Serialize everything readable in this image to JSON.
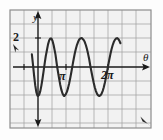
{
  "figure": {
    "name": "trig-graph",
    "background_color": "#fdfdfd",
    "grid_color": "#9a9a9a",
    "curve_color": "#2b2b2b",
    "axis_color": "#1a1a1a",
    "border_color": "#8d8d8d"
  },
  "labels": {
    "y_axis": "y",
    "x_axis": "θ",
    "y_tick_2": "2",
    "x_tick_pi": "π",
    "x_tick_2pi": "2π"
  },
  "chart_data": {
    "type": "line",
    "title": "",
    "xlabel": "θ",
    "ylabel": "y",
    "function": "y = -2 cos(2θ)",
    "amplitude": 2,
    "period": 3.14159,
    "frequency": 2,
    "xlim": [
      -0.55,
      7.4
    ],
    "ylim": [
      -2.75,
      2.75
    ],
    "xticks": [
      3.14159,
      6.28319
    ],
    "xticklabels": [
      "π",
      "2π"
    ],
    "yticks": [
      2
    ],
    "yticklabels": [
      "2"
    ],
    "grid": true,
    "grid_spacing_x": 0.3927,
    "grid_spacing_y": 0.55,
    "legend": "none",
    "x": [
      -0.55,
      -0.45,
      -0.35,
      -0.25,
      -0.15,
      -0.05,
      0.0,
      0.1,
      0.2,
      0.3,
      0.4,
      0.5,
      0.6,
      0.7,
      0.79,
      0.9,
      1.0,
      1.1,
      1.2,
      1.3,
      1.4,
      1.5,
      1.57,
      1.7,
      1.8,
      1.9,
      2.0,
      2.1,
      2.2,
      2.3,
      2.36,
      2.5,
      2.6,
      2.7,
      2.8,
      2.9,
      3.0,
      3.1,
      3.14,
      3.3,
      3.4,
      3.5,
      3.6,
      3.7,
      3.8,
      3.93,
      4.1,
      4.2,
      4.3,
      4.4,
      4.5,
      4.6,
      4.71,
      4.9,
      5.0,
      5.1,
      5.2,
      5.3,
      5.4,
      5.5,
      5.6,
      5.7,
      5.8,
      5.9,
      6.0,
      6.1,
      6.2,
      6.28,
      6.4,
      6.5,
      6.6,
      6.7,
      6.8,
      6.9,
      7.0,
      7.1,
      7.2,
      7.3,
      7.4
    ],
    "y": [
      0.88,
      0.16,
      -0.6,
      -1.25,
      -1.73,
      -1.97,
      -2.0,
      -1.92,
      -1.68,
      -1.3,
      -0.83,
      -0.3,
      0.25,
      0.77,
      1.12,
      1.56,
      1.83,
      1.97,
      1.96,
      1.81,
      1.52,
      1.13,
      0.85,
      0.12,
      -0.36,
      -0.82,
      -1.24,
      -1.58,
      -1.83,
      -1.97,
      -2.0,
      -1.87,
      -1.7,
      -1.44,
      -1.12,
      -0.74,
      -0.33,
      0.11,
      0.29,
      0.93,
      1.26,
      1.53,
      1.74,
      1.89,
      1.97,
      2.0,
      1.87,
      1.72,
      1.5,
      1.22,
      0.89,
      0.52,
      0.02,
      -0.72,
      -1.09,
      -1.41,
      -1.66,
      -1.85,
      -1.96,
      -2.0,
      -1.96,
      -1.85,
      -1.66,
      -1.41,
      -1.09,
      -0.72,
      -0.32,
      0.02,
      0.52,
      0.89,
      1.22,
      1.5,
      1.72,
      1.87,
      1.96,
      1.99,
      1.94,
      1.82,
      1.64
    ]
  }
}
